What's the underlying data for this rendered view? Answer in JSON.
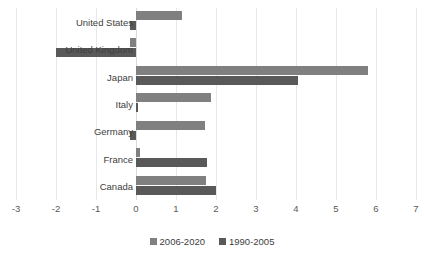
{
  "chart_data": {
    "type": "bar",
    "orientation": "horizontal",
    "title": "",
    "subtitle": "",
    "xlabel": "",
    "ylabel": "",
    "categories": [
      "United States",
      "United Kingdom",
      "Japan",
      "Italy",
      "Germany",
      "France",
      "Canada"
    ],
    "series": [
      {
        "name": "2006-2020",
        "color": "#808080",
        "values": [
          1.15,
          -0.15,
          5.8,
          1.88,
          1.72,
          0.1,
          1.75
        ]
      },
      {
        "name": "1990-2005",
        "color": "#595959",
        "values": [
          -0.15,
          -2.0,
          4.05,
          0.05,
          -0.15,
          1.78,
          2.0
        ]
      }
    ],
    "xlim": [
      -3,
      7
    ],
    "xticks": [
      "-3",
      "-2",
      "-1",
      "0",
      "1",
      "2",
      "3",
      "4",
      "5",
      "6",
      "7"
    ],
    "grid": true,
    "legend_position": "bottom"
  },
  "colors": {
    "series_2006_2020": "#808080",
    "series_1990_2005": "#595959",
    "gridline": "#e8e8e8",
    "background": "#ffffff",
    "text": "#404040"
  }
}
